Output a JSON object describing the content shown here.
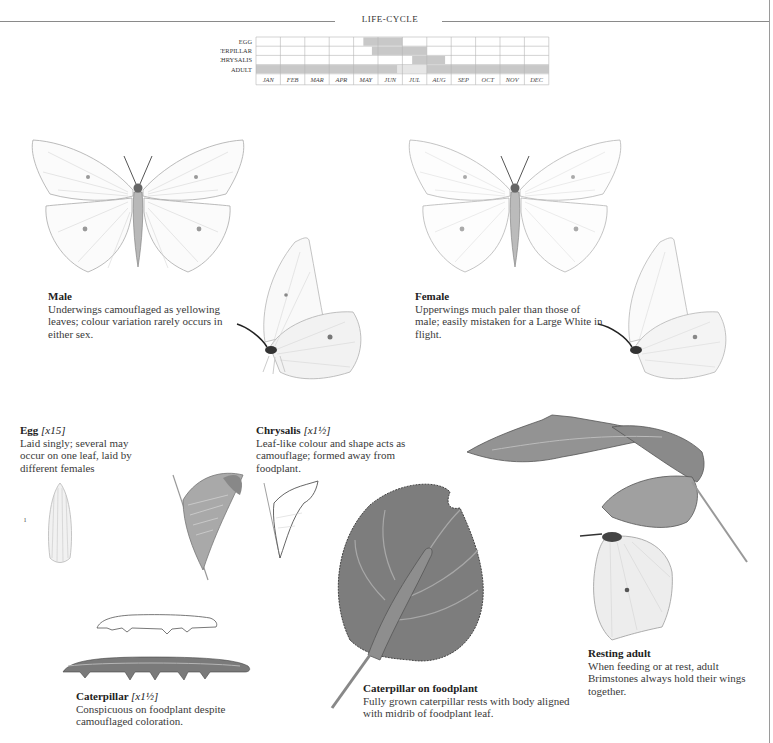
{
  "section_title": "LIFE-CYCLE",
  "chart_data": {
    "type": "gantt",
    "title": "LIFE-CYCLE",
    "categories": [
      "JAN",
      "FEB",
      "MAR",
      "APR",
      "MAY",
      "JUN",
      "JUL",
      "AUG",
      "SEP",
      "OCT",
      "NOV",
      "DEC"
    ],
    "stages": [
      {
        "name": "EGG",
        "periods": [
          {
            "start": 4.4,
            "end": 6.0,
            "shade": "medium"
          }
        ]
      },
      {
        "name": "CATERPILLAR",
        "periods": [
          {
            "start": 4.75,
            "end": 7.0,
            "shade": "medium"
          }
        ]
      },
      {
        "name": "CHRYSALIS",
        "periods": [
          {
            "start": 6.4,
            "end": 7.75,
            "shade": "medium"
          }
        ]
      },
      {
        "name": "ADULT",
        "periods": [
          {
            "start": 0.0,
            "end": 5.8,
            "shade": "medium"
          },
          {
            "start": 5.8,
            "end": 7.0,
            "shade": "light"
          },
          {
            "start": 7.0,
            "end": 12.0,
            "shade": "medium"
          }
        ]
      }
    ],
    "colors": {
      "medium": "#c8c8c8",
      "light": "#e6e6e6",
      "grid": "#b5b5b5"
    }
  },
  "captions": {
    "male": {
      "title": "Male",
      "text": "Underwings camouflaged as yellowing leaves; colour variation rarely occurs in either sex."
    },
    "female": {
      "title": "Female",
      "text": "Upperwings much paler than those of male; easily mistaken for a Large White in flight."
    },
    "egg": {
      "title": "Egg",
      "scale": "[x15]",
      "text": "Laid singly; several may occur on one leaf, laid by different females"
    },
    "chrysalis": {
      "title": "Chrysalis",
      "scale": "[x1½]",
      "text": "Leaf-like colour and shape acts as camouflage; formed away from foodplant."
    },
    "caterpillar": {
      "title": "Caterpillar",
      "scale": "[x1½]",
      "text": "Conspicuous on foodplant despite camouflaged coloration."
    },
    "caterpillar_foodplant": {
      "title": "Caterpillar on foodplant",
      "text": "Fully grown caterpillar rests with body aligned with midrib of foodplant leaf."
    },
    "resting_adult": {
      "title": "Resting adult",
      "text": "When feeding or at rest, adult Brimstones always hold their wings together."
    }
  },
  "egg_actual_size_mark": "ı"
}
